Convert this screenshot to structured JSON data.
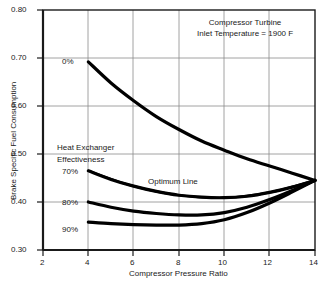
{
  "chart_data": {
    "type": "line",
    "title": "",
    "xlabel": "Compressor Pressure Ratio",
    "ylabel": "Brake Specific Fuel Consumption",
    "xlim": [
      2,
      14
    ],
    "ylim": [
      0.3,
      0.8
    ],
    "xticks": [
      "2",
      "4",
      "6",
      "8",
      "10",
      "12",
      "14"
    ],
    "yticks": [
      "0.30",
      "0.40",
      "0.50",
      "0.60",
      "0.70",
      "0.80"
    ],
    "grid": true,
    "legend_position": "inline-curve-labels",
    "annotations": [
      {
        "name": "turbine-inlet-temperature-note",
        "line1": "Compressor Turbine",
        "line2": "Inlet Temperature = 1900 F"
      },
      {
        "name": "heat-exchanger-effectiveness-note",
        "line1": "Heat Exchanger",
        "line2": "Effectiveness"
      },
      {
        "name": "optimum-line-note",
        "line1": "Optimum Line"
      }
    ],
    "series": [
      {
        "name": "0%",
        "label": "0%",
        "x": [
          4,
          5,
          6,
          7,
          8,
          9,
          10,
          11,
          12,
          13,
          14
        ],
        "values": [
          0.692,
          0.648,
          0.611,
          0.578,
          0.551,
          0.527,
          0.508,
          0.49,
          0.475,
          0.46,
          0.445
        ]
      },
      {
        "name": "70%",
        "label": "70%",
        "x": [
          4,
          5,
          6,
          7,
          8,
          9,
          10,
          11,
          12,
          13,
          14
        ],
        "values": [
          0.465,
          0.447,
          0.433,
          0.422,
          0.414,
          0.41,
          0.409,
          0.412,
          0.42,
          0.431,
          0.445
        ]
      },
      {
        "name": "80%",
        "label": "80%",
        "x": [
          4,
          5,
          6,
          7,
          8,
          9,
          10,
          11,
          12,
          13,
          14
        ],
        "values": [
          0.4,
          0.389,
          0.381,
          0.376,
          0.373,
          0.373,
          0.378,
          0.389,
          0.405,
          0.424,
          0.445
        ]
      },
      {
        "name": "90%",
        "label": "90%",
        "x": [
          4,
          5,
          6,
          7,
          8,
          9,
          10,
          11,
          12,
          13,
          14
        ],
        "values": [
          0.358,
          0.355,
          0.353,
          0.352,
          0.352,
          0.355,
          0.363,
          0.378,
          0.398,
          0.421,
          0.445
        ]
      },
      {
        "name": "Optimum Line",
        "label": "Optimum Line",
        "x": [
          4,
          6,
          8,
          10,
          12,
          14
        ],
        "values": [
          0.465,
          0.433,
          0.414,
          0.409,
          0.42,
          0.445
        ]
      }
    ],
    "colors": {
      "curve": "#000000",
      "grid": "#8c8c8c",
      "axis": "#1a1a1a",
      "background": "#ffffff"
    }
  }
}
